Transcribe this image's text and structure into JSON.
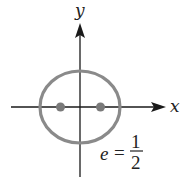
{
  "diagram": {
    "type": "ellipse-with-foci",
    "axes": {
      "x_label": "x",
      "y_label": "y",
      "color": "#1a1a1a"
    },
    "ellipse": {
      "center": [
        80,
        107
      ],
      "semi_major_axis_px": 40,
      "semi_minor_axis_px": 36,
      "stroke_color": "#8a8a8a"
    },
    "foci": [
      {
        "label": "left-focus",
        "position": [
          60,
          107
        ]
      },
      {
        "label": "right-focus",
        "position": [
          100,
          107
        ]
      }
    ],
    "focus_color": "#7a7a7a",
    "eccentricity": {
      "variable": "e",
      "equals": "=",
      "numerator": "1",
      "denominator": "2",
      "value": 0.5
    }
  }
}
